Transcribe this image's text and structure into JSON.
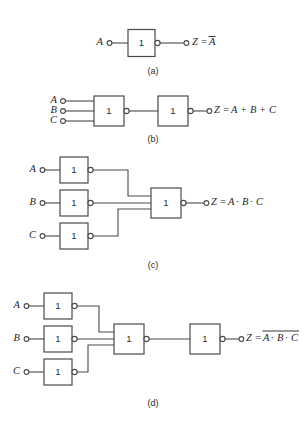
{
  "figure": {
    "background_color": "#ffffff",
    "line_color": "#4a4a4a",
    "text_color": "#1f1f1f",
    "gate_symbol_label": "1"
  },
  "panels": [
    {
      "id": "a",
      "caption": "(a)",
      "inputs": [
        "A"
      ],
      "output_expression": "Z = A",
      "output_prefix": "Z =",
      "output_terms": [
        "A"
      ],
      "output_overbar": true,
      "gate_count": 1,
      "description": "Single inverter (NOT gate): output is A bar"
    },
    {
      "id": "b",
      "caption": "(b)",
      "inputs": [
        "A",
        "B",
        "C"
      ],
      "output_expression": "Z = A + B + C",
      "output_prefix": "Z =",
      "output_terms": [
        "A",
        "B",
        "C"
      ],
      "output_operator": "+",
      "output_overbar": false,
      "gate_count": 2,
      "description": "Three-input NOR gate followed by inverter gives OR"
    },
    {
      "id": "c",
      "caption": "(c)",
      "inputs": [
        "A",
        "B",
        "C"
      ],
      "output_expression": "Z = A · B · C",
      "output_prefix": "Z =",
      "output_terms": [
        "A",
        "B",
        "C"
      ],
      "output_operator": "·",
      "output_overbar": false,
      "gate_count": 4,
      "description": "Three inverters feeding a NOR gate gives AND"
    },
    {
      "id": "d",
      "caption": "(d)",
      "inputs": [
        "A",
        "B",
        "C"
      ],
      "output_expression": "Z = A · B · C (inverted)",
      "output_prefix": "Z =",
      "output_terms": [
        "A",
        "B",
        "C"
      ],
      "output_operator": "·",
      "output_overbar": true,
      "gate_count": 5,
      "description": "Three inverters feeding a NOR gate then an inverter gives NAND"
    }
  ],
  "labels": {
    "A": "A",
    "B": "B",
    "C": "C",
    "Z_eq": "Z =",
    "plus": "+",
    "dot": "·",
    "gate": "1",
    "cap_a": "(a)",
    "cap_b": "(b)",
    "cap_c": "(c)",
    "cap_d": "(d)"
  }
}
